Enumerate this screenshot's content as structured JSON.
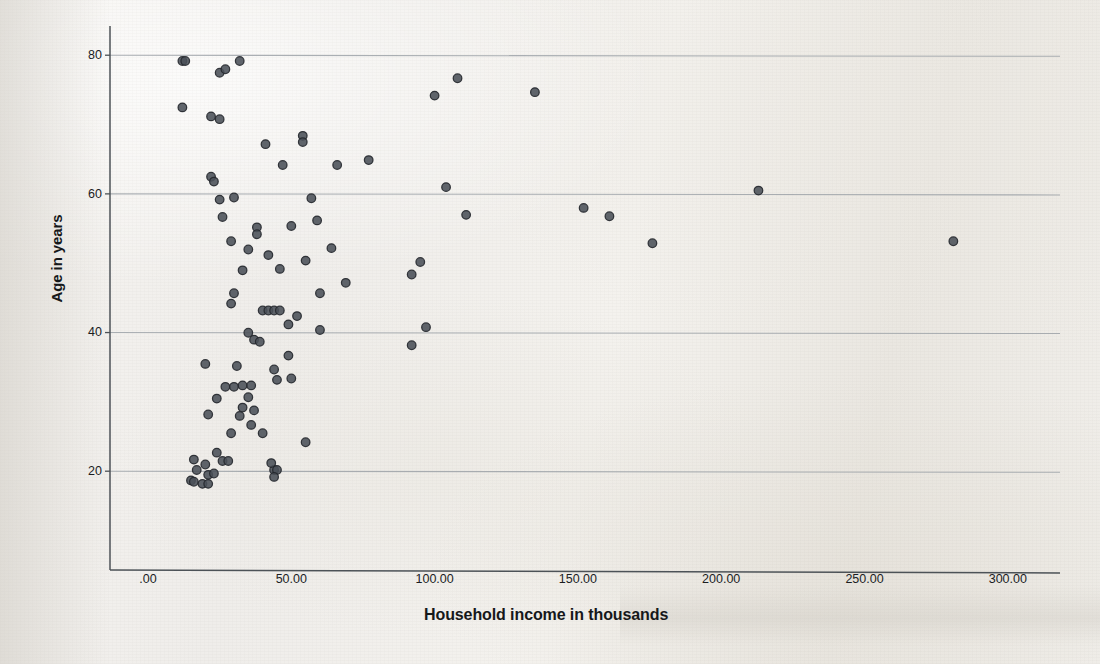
{
  "figure": {
    "kind": "scatterplot",
    "media": "scanned-page"
  },
  "axes": {
    "x_title": "Household income in thousands",
    "y_title": "Age in years",
    "x_ticks": [
      ".00",
      "50.00",
      "100.00",
      "150.00",
      "200.00",
      "250.00",
      "300.00"
    ],
    "y_ticks": [
      "80",
      "60",
      "40",
      "20"
    ]
  },
  "style": {
    "marker_color": "#4a5058",
    "marker_edge_color": "#23272c",
    "gridline_color": "#9aa0a6",
    "axis_color": "#4c5257",
    "background_color": "#f2f0ec"
  },
  "chart_data": {
    "type": "scatter",
    "title": "",
    "xlabel": "Household income in thousands",
    "ylabel": "Age in years",
    "xlim": [
      -10,
      315
    ],
    "ylim": [
      8,
      84
    ],
    "xticks": [
      0,
      50,
      100,
      150,
      200,
      250,
      300
    ],
    "yticks": [
      20,
      40,
      60,
      80
    ],
    "grid": "horizontal",
    "legend": "none",
    "n_points": 95,
    "series": [
      {
        "name": "respondents",
        "points": [
          [
            12,
            79.0
          ],
          [
            13,
            79.0
          ],
          [
            25,
            77.3
          ],
          [
            27,
            77.8
          ],
          [
            32,
            79.0
          ],
          [
            12,
            72.3
          ],
          [
            22,
            71.0
          ],
          [
            25,
            70.6
          ],
          [
            41,
            67.0
          ],
          [
            54,
            68.2
          ],
          [
            54,
            67.3
          ],
          [
            100,
            74.0
          ],
          [
            108,
            76.5
          ],
          [
            135,
            74.5
          ],
          [
            22,
            62.3
          ],
          [
            23,
            61.6
          ],
          [
            47,
            64.0
          ],
          [
            66,
            64.0
          ],
          [
            77,
            64.7
          ],
          [
            30,
            59.3
          ],
          [
            57,
            59.2
          ],
          [
            104,
            60.8
          ],
          [
            213,
            60.3
          ],
          [
            38,
            55.0
          ],
          [
            38,
            54.0
          ],
          [
            50,
            55.2
          ],
          [
            59,
            56.0
          ],
          [
            111,
            56.8
          ],
          [
            152,
            57.8
          ],
          [
            161,
            56.6
          ],
          [
            35,
            51.8
          ],
          [
            42,
            51.0
          ],
          [
            55,
            50.2
          ],
          [
            95,
            50.0
          ],
          [
            176,
            52.7
          ],
          [
            281,
            53.0
          ],
          [
            33,
            48.8
          ],
          [
            46,
            49.0
          ],
          [
            69,
            47.0
          ],
          [
            92,
            48.2
          ],
          [
            30,
            45.5
          ],
          [
            29,
            44.0
          ],
          [
            40,
            43.0
          ],
          [
            42,
            43.0
          ],
          [
            44,
            43.0
          ],
          [
            46,
            43.0
          ],
          [
            52,
            42.2
          ],
          [
            60,
            40.2
          ],
          [
            97,
            40.6
          ],
          [
            35,
            39.8
          ],
          [
            37,
            38.8
          ],
          [
            39,
            38.5
          ],
          [
            92,
            38.0
          ],
          [
            20,
            35.3
          ],
          [
            31,
            35.0
          ],
          [
            44,
            34.5
          ],
          [
            27,
            32.0
          ],
          [
            30,
            32.0
          ],
          [
            33,
            32.2
          ],
          [
            36,
            32.2
          ],
          [
            45,
            33.0
          ],
          [
            50,
            33.2
          ],
          [
            24,
            30.3
          ],
          [
            35,
            30.5
          ],
          [
            21,
            28.0
          ],
          [
            32,
            27.8
          ],
          [
            29,
            25.3
          ],
          [
            55,
            24.0
          ],
          [
            24,
            22.5
          ],
          [
            26,
            21.3
          ],
          [
            28,
            21.3
          ],
          [
            16,
            21.5
          ],
          [
            17,
            20.0
          ],
          [
            21,
            19.3
          ],
          [
            15,
            18.5
          ],
          [
            16,
            18.3
          ],
          [
            19,
            18.0
          ],
          [
            21,
            18.0
          ],
          [
            44,
            20.0
          ],
          [
            45,
            20.0
          ],
          [
            44,
            19.0
          ],
          [
            20,
            20.8
          ],
          [
            23,
            19.5
          ],
          [
            43,
            21.0
          ],
          [
            36,
            26.5
          ],
          [
            40,
            25.3
          ],
          [
            33,
            29.0
          ],
          [
            37,
            28.6
          ],
          [
            49,
            36.5
          ],
          [
            60,
            45.5
          ],
          [
            49,
            41.0
          ],
          [
            64,
            52.0
          ],
          [
            29,
            53.0
          ],
          [
            26,
            56.5
          ],
          [
            25,
            59.0
          ]
        ]
      }
    ]
  }
}
